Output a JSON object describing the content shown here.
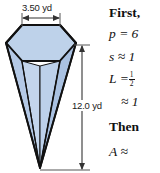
{
  "figure": {
    "name": "inverted-hexagonal-pyramid",
    "solid_type": "hexagonal pyramid",
    "top_dimension": {
      "label": "3.50 yd",
      "value": 3.5,
      "unit": "yd",
      "describes": "base edge / top width"
    },
    "height_dimension": {
      "label": "12.0 yd",
      "value": 12.0,
      "unit": "yd",
      "describes": "slant/vertical height"
    },
    "colors": {
      "top_face": "#bed2ea",
      "left_face": "#b4c9e6",
      "front_face": "#c3d5ec",
      "right_face": "#a9c1e1",
      "outline": "#111111",
      "dimension_line": "#555555"
    }
  },
  "solution": {
    "lines": [
      {
        "id": "first",
        "text": "First,"
      },
      {
        "id": "p",
        "text": "p = 6"
      },
      {
        "id": "s",
        "text": "s ≈ 1"
      },
      {
        "id": "L",
        "text": "L =",
        "fraction_num": "1",
        "fraction_den": "2"
      },
      {
        "id": "Lapp",
        "text": "≈ 1"
      },
      {
        "id": "then",
        "text": "Then"
      },
      {
        "id": "A",
        "text": "A ≈"
      }
    ],
    "first_label": "First,",
    "p_label": "p = 6",
    "s_label": "s ≈ 1",
    "L_label": "L =",
    "L_frac_num": "1",
    "L_frac_den": "2",
    "Lapp_label": "≈ 1",
    "then_label": "Then",
    "A_label": "A ≈"
  }
}
